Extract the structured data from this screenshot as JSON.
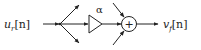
{
  "diagram": {
    "input": {
      "symbol": "u",
      "subscript": "r",
      "index": "[n]"
    },
    "gain": {
      "label": "α"
    },
    "adder": {
      "symbol": "+"
    },
    "output": {
      "symbol": "v",
      "subscript": "f",
      "index": "[n]"
    },
    "colors": {
      "stroke": "#222222",
      "background": "#ffffff"
    }
  }
}
